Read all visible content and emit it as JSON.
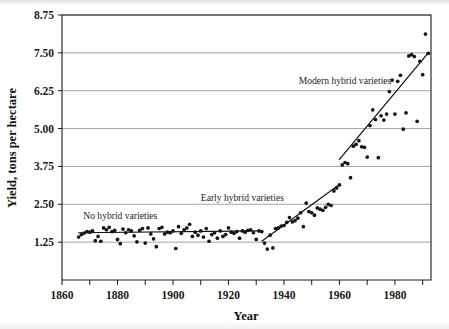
{
  "chart_data": {
    "type": "scatter",
    "title": "",
    "xlabel": "Year",
    "ylabel": "Yield, tons per hectare",
    "xlim": [
      1860,
      1993
    ],
    "ylim": [
      0.0,
      8.75
    ],
    "grid": true,
    "legend": "none",
    "x_ticks_major": [
      1860,
      1880,
      1900,
      1920,
      1940,
      1960,
      1980
    ],
    "x_ticks_minor": [
      1870,
      1890,
      1910,
      1930,
      1950,
      1970,
      1990
    ],
    "y_ticks": [
      1.25,
      2.5,
      3.75,
      5.0,
      6.25,
      7.5,
      8.75
    ],
    "y_tick_labels": [
      "1.25",
      "2.50",
      "3.75",
      "5.00",
      "6.25",
      "7.50",
      "8.75"
    ],
    "x_tick_labels": [
      "1860",
      "1880",
      "1900",
      "1920",
      "1940",
      "1960",
      "1980"
    ],
    "annotations": [
      {
        "text": "No hybrid varieties",
        "x": 1881,
        "y": 2.02
      },
      {
        "text": "Early hybrid varieties",
        "x": 1925,
        "y": 2.62
      },
      {
        "text": "Modern hybrid varieties",
        "x": 1962,
        "y": 6.46
      }
    ],
    "trend_segments": [
      {
        "name": "No hybrid varieties",
        "x0": 1866,
        "y0": 1.56,
        "x1": 1931,
        "y1": 1.62
      },
      {
        "name": "Early hybrid varieties",
        "x0": 1932,
        "y0": 1.28,
        "x1": 1960,
        "y1": 3.15
      },
      {
        "name": "Modern hybrid varieties",
        "x0": 1960,
        "y0": 3.98,
        "x1": 1992,
        "y1": 7.5
      }
    ],
    "series": [
      {
        "name": "Corn yield",
        "points": [
          [
            1866,
            1.42
          ],
          [
            1867,
            1.5
          ],
          [
            1868,
            1.55
          ],
          [
            1869,
            1.6
          ],
          [
            1870,
            1.58
          ],
          [
            1871,
            1.62
          ],
          [
            1872,
            1.3
          ],
          [
            1873,
            1.44
          ],
          [
            1874,
            1.28
          ],
          [
            1875,
            1.72
          ],
          [
            1876,
            1.66
          ],
          [
            1877,
            1.74
          ],
          [
            1878,
            1.6
          ],
          [
            1879,
            1.64
          ],
          [
            1880,
            1.34
          ],
          [
            1881,
            1.2
          ],
          [
            1882,
            1.68
          ],
          [
            1883,
            1.56
          ],
          [
            1884,
            1.66
          ],
          [
            1885,
            1.62
          ],
          [
            1886,
            1.46
          ],
          [
            1887,
            1.26
          ],
          [
            1888,
            1.64
          ],
          [
            1889,
            1.7
          ],
          [
            1890,
            1.22
          ],
          [
            1891,
            1.72
          ],
          [
            1892,
            1.52
          ],
          [
            1893,
            1.36
          ],
          [
            1894,
            1.1
          ],
          [
            1895,
            1.7
          ],
          [
            1896,
            1.74
          ],
          [
            1897,
            1.52
          ],
          [
            1898,
            1.58
          ],
          [
            1899,
            1.56
          ],
          [
            1900,
            1.62
          ],
          [
            1901,
            1.04
          ],
          [
            1902,
            1.76
          ],
          [
            1903,
            1.54
          ],
          [
            1904,
            1.66
          ],
          [
            1905,
            1.72
          ],
          [
            1906,
            1.84
          ],
          [
            1907,
            1.44
          ],
          [
            1908,
            1.58
          ],
          [
            1909,
            1.48
          ],
          [
            1910,
            1.62
          ],
          [
            1911,
            1.42
          ],
          [
            1912,
            1.7
          ],
          [
            1913,
            1.28
          ],
          [
            1914,
            1.5
          ],
          [
            1915,
            1.56
          ],
          [
            1916,
            1.38
          ],
          [
            1917,
            1.62
          ],
          [
            1918,
            1.44
          ],
          [
            1919,
            1.5
          ],
          [
            1920,
            1.72
          ],
          [
            1921,
            1.58
          ],
          [
            1922,
            1.54
          ],
          [
            1923,
            1.6
          ],
          [
            1924,
            1.38
          ],
          [
            1925,
            1.62
          ],
          [
            1926,
            1.58
          ],
          [
            1927,
            1.64
          ],
          [
            1928,
            1.66
          ],
          [
            1929,
            1.56
          ],
          [
            1930,
            1.34
          ],
          [
            1931,
            1.62
          ],
          [
            1932,
            1.6
          ],
          [
            1933,
            1.22
          ],
          [
            1934,
            1.02
          ],
          [
            1935,
            1.48
          ],
          [
            1936,
            1.06
          ],
          [
            1937,
            1.7
          ],
          [
            1938,
            1.72
          ],
          [
            1939,
            1.78
          ],
          [
            1940,
            1.8
          ],
          [
            1941,
            1.9
          ],
          [
            1942,
            2.06
          ],
          [
            1943,
            1.92
          ],
          [
            1944,
            1.96
          ],
          [
            1945,
            2.04
          ],
          [
            1946,
            2.22
          ],
          [
            1947,
            1.76
          ],
          [
            1948,
            2.54
          ],
          [
            1949,
            2.26
          ],
          [
            1950,
            2.22
          ],
          [
            1951,
            2.14
          ],
          [
            1952,
            2.38
          ],
          [
            1953,
            2.34
          ],
          [
            1954,
            2.3
          ],
          [
            1955,
            2.4
          ],
          [
            1956,
            2.5
          ],
          [
            1957,
            2.46
          ],
          [
            1958,
            2.94
          ],
          [
            1959,
            3.04
          ],
          [
            1960,
            3.14
          ],
          [
            1961,
            3.8
          ],
          [
            1962,
            3.88
          ],
          [
            1963,
            3.84
          ],
          [
            1964,
            3.38
          ],
          [
            1965,
            4.42
          ],
          [
            1966,
            4.48
          ],
          [
            1967,
            4.6
          ],
          [
            1968,
            4.4
          ],
          [
            1969,
            4.38
          ],
          [
            1970,
            4.06
          ],
          [
            1971,
            5.1
          ],
          [
            1972,
            5.62
          ],
          [
            1973,
            5.3
          ],
          [
            1974,
            4.04
          ],
          [
            1975,
            5.42
          ],
          [
            1976,
            5.28
          ],
          [
            1977,
            5.48
          ],
          [
            1978,
            6.22
          ],
          [
            1979,
            6.6
          ],
          [
            1980,
            5.48
          ],
          [
            1981,
            6.56
          ],
          [
            1982,
            6.76
          ],
          [
            1983,
            4.98
          ],
          [
            1984,
            5.52
          ],
          [
            1985,
            7.4
          ],
          [
            1986,
            7.44
          ],
          [
            1987,
            7.38
          ],
          [
            1988,
            5.24
          ],
          [
            1989,
            7.22
          ],
          [
            1990,
            6.78
          ],
          [
            1991,
            8.12
          ],
          [
            1992,
            7.48
          ]
        ]
      }
    ]
  }
}
